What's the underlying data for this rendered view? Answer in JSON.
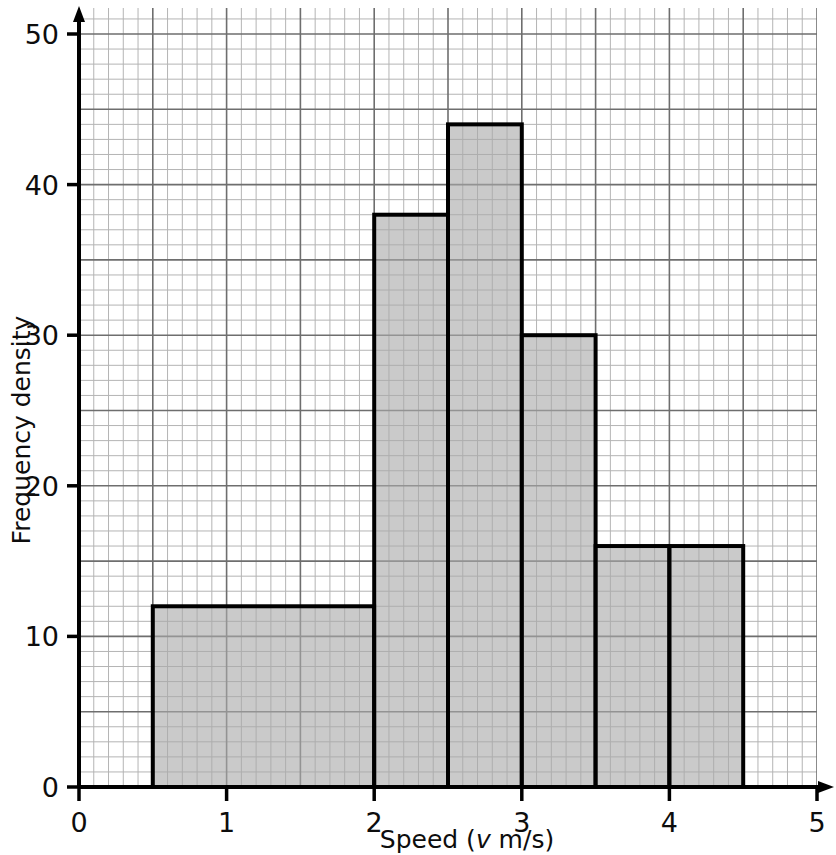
{
  "chart_data": {
    "type": "bar",
    "title": "",
    "subtitle": "",
    "xlabel": "Speed (v m/s)",
    "xlabel_parts": {
      "before": "Speed (",
      "italic": "v",
      "after": " m/s)"
    },
    "ylabel": "Frequency density",
    "xlim": [
      0,
      5
    ],
    "ylim": [
      0,
      51
    ],
    "xticks": [
      0,
      1,
      2,
      3,
      4,
      5
    ],
    "xtick_labels": [
      "0",
      "1",
      "2",
      "3",
      "4",
      "5"
    ],
    "yticks": [
      0,
      10,
      20,
      30,
      40,
      50
    ],
    "ytick_labels": [
      "0",
      "10",
      "20",
      "30",
      "40",
      "50"
    ],
    "grid": true,
    "grid_minor_step_x": 0.1,
    "grid_minor_step_y": 1,
    "grid_major_step_x": 0.5,
    "grid_major_step_y": 5,
    "legend": null,
    "bin_edges": [
      0.5,
      2.0,
      2.5,
      3.0,
      3.5,
      4.0,
      4.5
    ],
    "bars": [
      {
        "label": "0.5-2.0",
        "x_start": 0.5,
        "x_end": 2.0,
        "value": 12,
        "frequency": 18
      },
      {
        "label": "2.0-2.5",
        "x_start": 2.0,
        "x_end": 2.5,
        "value": 38,
        "frequency": 19
      },
      {
        "label": "2.5-3.0",
        "x_start": 2.5,
        "x_end": 3.0,
        "value": 44,
        "frequency": 22
      },
      {
        "label": "3.0-3.5",
        "x_start": 3.0,
        "x_end": 3.5,
        "value": 30,
        "frequency": 15
      },
      {
        "label": "3.5-4.0",
        "x_start": 3.5,
        "x_end": 4.0,
        "value": 16,
        "frequency": 8
      },
      {
        "label": "4.0-4.5",
        "x_start": 4.0,
        "x_end": 4.5,
        "value": 16,
        "frequency": 8
      }
    ],
    "categories": [
      "0.5-2.0",
      "2.0-2.5",
      "2.5-3.0",
      "3.0-3.5",
      "3.5-4.0",
      "4.0-4.5"
    ],
    "values": [
      12,
      38,
      44,
      30,
      16,
      16
    ],
    "colors": {
      "bar_fill": "#a9a9a9",
      "bar_stroke": "#000000",
      "axis": "#000000",
      "grid_minor": "#b4b4b4",
      "grid_major": "#6e6e6e",
      "text": "#0d0d0d",
      "background": "#ffffff"
    }
  }
}
